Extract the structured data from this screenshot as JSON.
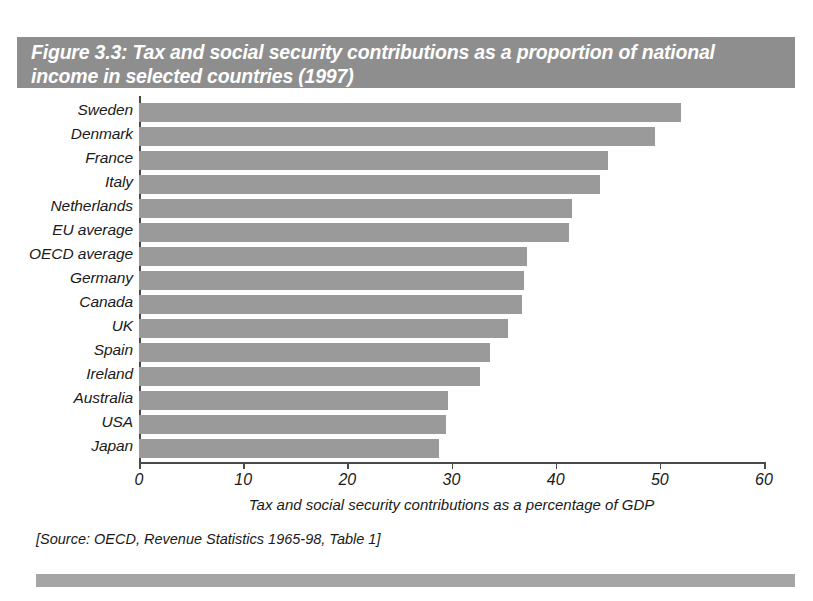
{
  "figure": {
    "title": "Figure 3.3: Tax and social security contributions as a proportion of national income in selected countries (1997)",
    "source_note": "[Source: OECD, Revenue Statistics 1965-98, Table 1]",
    "banner_color": "#8e8e8e",
    "bar_color": "#9a9a9a",
    "axis_color": "#4a4a4a",
    "footer_color": "#a5a5a5"
  },
  "chart_data": {
    "type": "bar",
    "orientation": "horizontal",
    "title": "Figure 3.3: Tax and social security contributions as a proportion of national income in selected countries (1997)",
    "xlabel": "Tax and social security contributions as a percentage of GDP",
    "ylabel": "",
    "xlim": [
      0,
      60
    ],
    "xticks": [
      0,
      10,
      20,
      30,
      40,
      50,
      60
    ],
    "xtick_labels": [
      "0",
      "10",
      "20",
      "30",
      "40",
      "50",
      "60"
    ],
    "grid": false,
    "legend": false,
    "categories": [
      "Sweden",
      "Denmark",
      "France",
      "Italy",
      "Netherlands",
      "EU average",
      "OECD average",
      "Germany",
      "Canada",
      "UK",
      "Spain",
      "Ireland",
      "Australia",
      "USA",
      "Japan"
    ],
    "values": [
      52.0,
      49.5,
      45.0,
      44.3,
      41.6,
      41.3,
      37.2,
      37.0,
      36.8,
      35.4,
      33.7,
      32.7,
      29.7,
      29.5,
      28.8
    ],
    "units": "percent of GDP",
    "year": 1997
  }
}
